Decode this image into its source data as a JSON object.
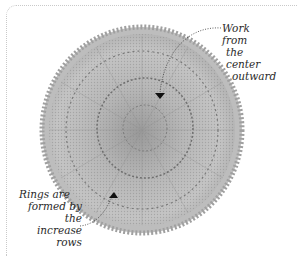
{
  "figure": {
    "annotations": [
      {
        "id": "center",
        "lines": [
          "Work from",
          "the center",
          "outward"
        ]
      },
      {
        "id": "rings",
        "lines": [
          "Rings are",
          "formed by the",
          "increase rows"
        ]
      }
    ],
    "colors": {
      "yarn_light": "#cfcfcf",
      "yarn_mid": "#a9a9a9",
      "yarn_dark": "#6e6e6e",
      "frame": "#c9c9c9",
      "text": "#2a2a2a"
    }
  }
}
